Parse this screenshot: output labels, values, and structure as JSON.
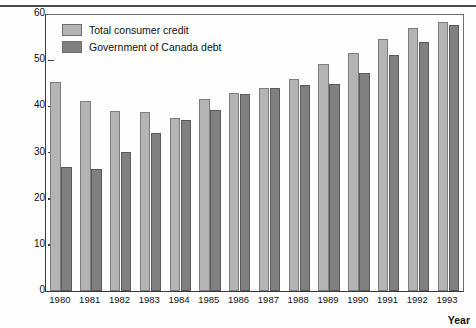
{
  "chart_data": {
    "type": "bar",
    "title": "",
    "xlabel": "Year",
    "ylabel": "Debt (percentage of GDP)",
    "ylim": [
      0,
      60
    ],
    "yticks": [
      0,
      10,
      20,
      30,
      40,
      50,
      60
    ],
    "grid": false,
    "legend_position": "top-left",
    "categories": [
      "1980",
      "1981",
      "1982",
      "1983",
      "1984",
      "1985",
      "1986",
      "1987",
      "1988",
      "1989",
      "1990",
      "1991",
      "1992",
      "1993"
    ],
    "series": [
      {
        "name": "Total consumer credit",
        "color": "#b4b4b4",
        "values": [
          45.3,
          41.2,
          39.0,
          38.7,
          37.5,
          41.5,
          42.8,
          43.9,
          46.0,
          49.2,
          51.6,
          54.5,
          57.0,
          58.3
        ]
      },
      {
        "name": "Government of Canada debt",
        "color": "#808080",
        "values": [
          26.8,
          26.5,
          30.2,
          34.2,
          37.1,
          39.3,
          42.6,
          44.0,
          44.6,
          44.9,
          47.2,
          51.2,
          53.9,
          57.6
        ]
      }
    ]
  },
  "legend": {
    "items": [
      {
        "label": "Total consumer credit",
        "swatch": "light"
      },
      {
        "label": "Government of Canada debt",
        "swatch": "dark"
      }
    ]
  },
  "axis": {
    "y_title": "Debt (percentage of GDP)",
    "x_title": "Year"
  }
}
